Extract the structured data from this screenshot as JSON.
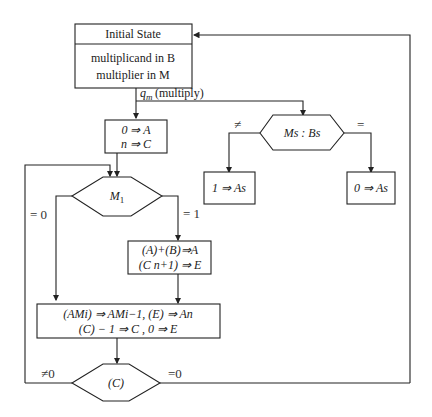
{
  "diagram": {
    "initial_state": {
      "title": "Initial State",
      "line1": "multiplicand in B",
      "line2": "multiplier in M"
    },
    "edge_multiply": "q_m (multiply)",
    "edge_multiply_q": "q",
    "edge_multiply_sub": "m",
    "edge_multiply_text": "(multiply)",
    "init_box": {
      "line1": "0 ⇒ A",
      "line2": "n ⇒ C"
    },
    "sign_decision": {
      "label": "Ms : Bs",
      "ne_label": "≠",
      "eq_label": "="
    },
    "sign_ne_box": "1 ⇒ As",
    "sign_eq_box": "0 ⇒ As",
    "m1_decision": {
      "label": "M1",
      "zero_label": "= 0",
      "one_label": "= 1"
    },
    "add_box": {
      "line1": "(A)+(B)⇒A",
      "line2": "(C n+1) ⇒ E"
    },
    "shift_box": {
      "line1": "(AMi) ⇒ AMi−1, (E) ⇒ An",
      "line2": "(C) − 1 ⇒ C , 0 ⇒ E"
    },
    "c_decision": {
      "label": "(C)",
      "ne_label": "≠0",
      "eq_label": "=0"
    }
  }
}
